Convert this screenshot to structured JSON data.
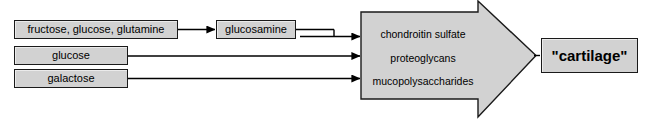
{
  "diagram": {
    "background_color": "#ffffff",
    "node_fill_color": "#d2d2d2",
    "node_border_color": "#1a1a1a",
    "arrow_fill_color": "#d2d2d2",
    "text_color": "#000000",
    "inputs": [
      {
        "id": "substrates",
        "label": "fructose, glucose, glutamine"
      },
      {
        "id": "glucose",
        "label": "glucose"
      },
      {
        "id": "galactose",
        "label": "galactose"
      }
    ],
    "intermediate": {
      "id": "glucosamine",
      "label": "glucosamine"
    },
    "products_arrow": {
      "name": "products-arrow",
      "items": [
        "chondroitin sulfate",
        "proteoglycans",
        "mucopolysaccharides"
      ]
    },
    "outcome": {
      "id": "cartilage",
      "label": "\"cartilage\""
    }
  }
}
